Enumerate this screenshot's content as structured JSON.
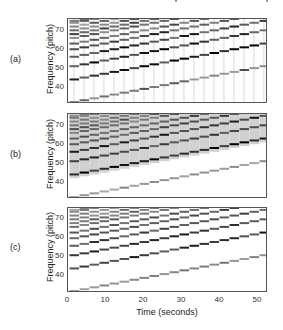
{
  "chart_data": [
    {
      "id": "a",
      "type": "heatmap",
      "panel_label": "(a)",
      "ylabel": "Frequency (pitch)",
      "xlabel": "",
      "yticks": [
        40,
        50,
        60,
        70
      ],
      "ylim": [
        31,
        76
      ],
      "xlim": [
        0,
        52
      ],
      "description": "Spectrogram-like piano-roll: 20 notes, fundamental rising by semitone from pitch 32 to 51, with harmonic partials; vertical smearing/noise present",
      "notes": {
        "count": 20,
        "start_pitch": 32,
        "step": 1,
        "duration": 2.6
      },
      "harmonic_offsets": [
        0,
        12,
        19,
        24,
        28,
        31,
        34,
        36,
        38,
        40,
        42,
        43
      ],
      "harmonic_intensity": [
        0.55,
        0.85,
        0.8,
        0.75,
        0.7,
        0.65,
        0.6,
        0.6,
        0.55,
        0.5,
        0.5,
        0.45
      ],
      "noise": 0.18,
      "smear": true
    },
    {
      "id": "b",
      "type": "heatmap",
      "panel_label": "(b)",
      "ylabel": "Frequency (pitch)",
      "xlabel": "",
      "yticks": [
        40,
        50,
        60,
        70
      ],
      "ylim": [
        31,
        76
      ],
      "xlim": [
        0,
        52
      ],
      "description": "Smoothed representation: same harmonic stair-steps with broad grey background above the fundamental",
      "notes": {
        "count": 20,
        "start_pitch": 32,
        "step": 1,
        "duration": 2.6
      },
      "harmonic_offsets": [
        0,
        12,
        19,
        24,
        28,
        31,
        34,
        36,
        38,
        40,
        42,
        43
      ],
      "harmonic_intensity": [
        0.45,
        0.95,
        0.8,
        0.85,
        0.7,
        0.7,
        0.6,
        0.65,
        0.55,
        0.5,
        0.5,
        0.45
      ],
      "noise": 0.0,
      "smear": false,
      "background_band": true
    },
    {
      "id": "c",
      "type": "heatmap",
      "panel_label": "(c)",
      "ylabel": "Frequency (pitch)",
      "xlabel": "Time (seconds)",
      "yticks": [
        40,
        50,
        60,
        70
      ],
      "xticks": [
        0,
        10,
        20,
        30,
        40,
        50
      ],
      "ylim": [
        31,
        76
      ],
      "xlim": [
        0,
        52
      ],
      "description": "Clean piano-roll of harmonic partials, no background",
      "notes": {
        "count": 20,
        "start_pitch": 32,
        "step": 1,
        "duration": 2.6
      },
      "harmonic_offsets": [
        0,
        12,
        19,
        24,
        28,
        31,
        34,
        36,
        38,
        40,
        42,
        43
      ],
      "harmonic_intensity": [
        0.5,
        0.85,
        0.85,
        0.75,
        0.7,
        0.7,
        0.6,
        0.6,
        0.55,
        0.5,
        0.5,
        0.45
      ],
      "noise": 0.0,
      "smear": false
    }
  ],
  "labels": {
    "panel_a": "(a)",
    "panel_b": "(b)",
    "panel_c": "(c)",
    "ylabel": "Frequency (pitch)",
    "xlabel": "Time (seconds)",
    "yticks": [
      "70",
      "60",
      "50",
      "40"
    ],
    "xticks": [
      "0",
      "10",
      "20",
      "30",
      "40",
      "50"
    ]
  }
}
